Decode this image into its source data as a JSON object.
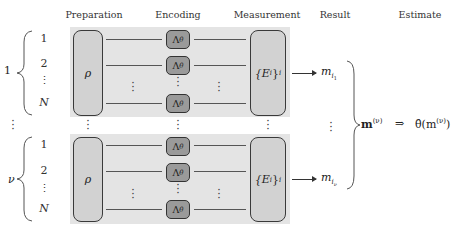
{
  "headers": {
    "preparation": "Preparation",
    "encoding": "Encoding",
    "measurement": "Measurement",
    "result": "Result",
    "estimate": "Estimate"
  },
  "groups": [
    {
      "label": "1",
      "indices": [
        "1",
        "2",
        "⋮",
        "N"
      ],
      "state": "ρ",
      "channel": "Λ",
      "channel_sub": "θ",
      "measurement": "{E",
      "measurement_sub": "i",
      "measurement_close": "}",
      "measurement_sub2": "i",
      "result": "m",
      "result_sub": "i",
      "result_subsub": "1"
    },
    {
      "label": "ν",
      "indices": [
        "1",
        "2",
        "⋮",
        "N"
      ],
      "state": "ρ",
      "channel": "Λ",
      "channel_sub": "θ",
      "measurement": "{E",
      "measurement_sub": "i",
      "measurement_close": "}",
      "measurement_sub2": "i",
      "result": "m",
      "result_sub": "i",
      "result_subsub": "ν"
    }
  ],
  "between_dots": "⋮",
  "aggregate": {
    "vector": "m",
    "vector_sup": "(ν)",
    "implies": "⇒",
    "estimator": "θ̂(m",
    "estimator_sup": "(ν)",
    "estimator_close": ")"
  },
  "colors": {
    "block_bg": "#e4e4e4",
    "state_box": "#d2d2d2",
    "channel_box": "#9a9a9a",
    "stroke": "#333333"
  }
}
